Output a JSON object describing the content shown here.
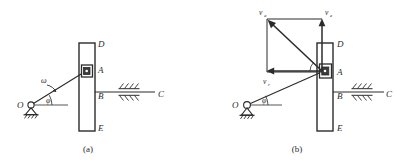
{
  "figure": {
    "title": "",
    "panels": [
      {
        "caption": "(a)",
        "labels": {
          "pivot": "O",
          "slider": "A",
          "bar_top": "D",
          "bar_bottom": "E",
          "guide_point": "B",
          "guide_end": "C",
          "angular_velocity": "ω",
          "angle": "φ"
        }
      },
      {
        "caption": "(b)",
        "labels": {
          "pivot": "O",
          "slider": "A",
          "bar_top": "D",
          "bar_bottom": "E",
          "guide_point": "B",
          "guide_end": "C",
          "angle": "φ"
        },
        "vectors": [
          {
            "name": "v_a",
            "symbol": "v",
            "subscript": "a",
            "direction": "up-left"
          },
          {
            "name": "v_e",
            "symbol": "v",
            "subscript": "e",
            "direction": "up"
          },
          {
            "name": "v_r",
            "symbol": "v",
            "subscript": "r",
            "direction": "left"
          }
        ]
      }
    ],
    "colors": {
      "line": "#2b2b2b",
      "background": "#ffffff"
    }
  }
}
